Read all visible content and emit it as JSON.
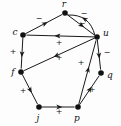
{
  "figure": {
    "type": "signed-directed-graph",
    "background_color": "#fdfdfd",
    "stroke_color": "#1a1a1a",
    "node_fill": "#111111"
  },
  "chart_data": {
    "type": "diagram",
    "title": "",
    "nodes": [
      {
        "id": "r",
        "label": "r",
        "x": 65,
        "y": 13,
        "label_x": 64,
        "label_y": 7
      },
      {
        "id": "c",
        "label": "c",
        "x": 23,
        "y": 35,
        "label_x": 15,
        "label_y": 35
      },
      {
        "id": "u",
        "label": "u",
        "x": 97,
        "y": 37,
        "label_x": 106,
        "label_y": 36
      },
      {
        "id": "f",
        "label": "f",
        "x": 21,
        "y": 72,
        "label_x": 13,
        "label_y": 75
      },
      {
        "id": "q",
        "label": "q",
        "x": 101,
        "y": 73,
        "label_x": 110,
        "label_y": 78
      },
      {
        "id": "j",
        "label": "j",
        "x": 39,
        "y": 107,
        "label_x": 38,
        "label_y": 121
      },
      {
        "id": "p",
        "label": "p",
        "x": 78,
        "y": 107,
        "label_x": 77,
        "label_y": 121
      }
    ],
    "edges": [
      {
        "from": "c",
        "to": "r",
        "sign": "-",
        "sign_x": 39,
        "sign_y": 21,
        "curve": 0
      },
      {
        "from": "r",
        "to": "u",
        "sign": "-",
        "sign_x": 84,
        "sign_y": 16,
        "curve": 0
      },
      {
        "from": "u",
        "to": "r",
        "sign": "-",
        "sign_x": 82,
        "sign_y": 26,
        "curve": 14
      },
      {
        "from": "u",
        "to": "c",
        "sign": "+",
        "sign_x": 59,
        "sign_y": 45,
        "curve": 0
      },
      {
        "from": "u",
        "to": "f",
        "sign": "+",
        "sign_x": 59,
        "sign_y": 60,
        "curve": 0
      },
      {
        "from": "c",
        "to": "f",
        "sign": "+",
        "sign_x": 13,
        "sign_y": 54,
        "curve": 0
      },
      {
        "from": "f",
        "to": "j",
        "sign": "+",
        "sign_x": 23,
        "sign_y": 93,
        "curve": 0
      },
      {
        "from": "j",
        "to": "p",
        "sign": "+",
        "sign_x": 59,
        "sign_y": 114,
        "curve": 0
      },
      {
        "from": "p",
        "to": "u",
        "sign": "+",
        "sign_x": 81,
        "sign_y": 65,
        "curve": 0
      },
      {
        "from": "p",
        "to": "q",
        "sign": "+",
        "sign_x": 92,
        "sign_y": 92,
        "curve": 0
      },
      {
        "from": "u",
        "to": "q",
        "sign": "-",
        "sign_x": 107,
        "sign_y": 55,
        "curve": 0
      }
    ],
    "signs_legend": {
      "positive": "+",
      "negative": "-"
    }
  }
}
